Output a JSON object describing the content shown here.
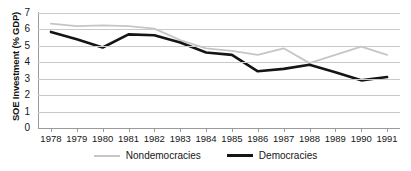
{
  "chart_data": {
    "type": "line",
    "title": "",
    "xlabel": "",
    "ylabel": "SOE Investment (% GDP)",
    "categories": [
      "1978",
      "1979",
      "1980",
      "1981",
      "1982",
      "1983",
      "1984",
      "1985",
      "1986",
      "1987",
      "1988",
      "1989",
      "1990",
      "1991"
    ],
    "ylim": [
      0,
      7
    ],
    "ytick_labels": [
      "0",
      "1",
      "2",
      "3",
      "4",
      "5",
      "6",
      "7"
    ],
    "grid": true,
    "legend_position": "bottom",
    "series": [
      {
        "name": "Nondemocracies",
        "color": "#c6c6c6",
        "values": [
          6.35,
          6.2,
          6.25,
          6.2,
          6.05,
          5.35,
          4.85,
          4.7,
          4.45,
          4.85,
          3.95,
          4.45,
          4.95,
          4.45
        ]
      },
      {
        "name": "Democracies",
        "color": "#151515",
        "values": [
          5.85,
          5.4,
          4.9,
          5.7,
          5.65,
          5.2,
          4.6,
          4.45,
          3.45,
          3.6,
          3.85,
          3.4,
          2.9,
          3.1
        ]
      }
    ]
  },
  "legend": {
    "items": [
      {
        "label": "Nondemocracies"
      },
      {
        "label": "Democracies"
      }
    ]
  }
}
